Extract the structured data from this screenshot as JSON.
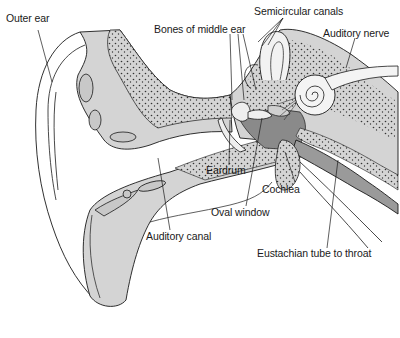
{
  "labels": {
    "outer_ear": "Outer ear",
    "bones_middle_ear": "Bones of middle ear",
    "semicircular_canals": "Semicircular canals",
    "auditory_nerve": "Auditory nerve",
    "eardrum": "Eardrum",
    "cochlea": "Cochlea",
    "oval_window": "Oval window",
    "auditory_canal": "Auditory canal",
    "eustachian_tube": "Eustachian tube to throat"
  },
  "colors": {
    "tissue_light": "#d4d4d4",
    "tissue_mid": "#bdbdbd",
    "tissue_dark": "#8a8a8a",
    "outline": "#1a1a1a",
    "background": "#ffffff"
  }
}
